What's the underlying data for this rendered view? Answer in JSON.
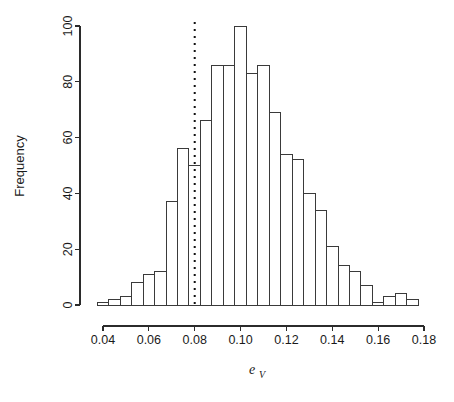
{
  "chart_data": {
    "type": "bar",
    "title": "",
    "subtitle": "",
    "xlabel": "e_V",
    "xlabel_base": "e",
    "xlabel_sub": "V",
    "ylabel": "Frequency",
    "xlim": [
      0.0355,
      0.1805
    ],
    "ylim": [
      0,
      103
    ],
    "grid": false,
    "legend": null,
    "bin_width": 0.005,
    "x_ticks": [
      0.04,
      0.06,
      0.08,
      0.1,
      0.12,
      0.14,
      0.16,
      0.18
    ],
    "x_tick_labels": [
      "0.04",
      "0.06",
      "0.08",
      "0.10",
      "0.12",
      "0.14",
      "0.16",
      "0.18"
    ],
    "y_ticks": [
      0,
      20,
      40,
      60,
      80,
      100
    ],
    "y_tick_labels": [
      "0",
      "20",
      "40",
      "60",
      "80",
      "100"
    ],
    "bin_edges": [
      0.0375,
      0.0425,
      0.0475,
      0.0525,
      0.0575,
      0.0625,
      0.0675,
      0.0725,
      0.0775,
      0.0825,
      0.0875,
      0.0925,
      0.0975,
      0.1025,
      0.1075,
      0.1125,
      0.1175,
      0.1225,
      0.1275,
      0.1325,
      0.1375,
      0.1425,
      0.1475,
      0.1525,
      0.1575,
      0.1625,
      0.1675,
      0.1725,
      0.1775
    ],
    "categories": [
      "0.0375-0.0425",
      "0.0425-0.0475",
      "0.0475-0.0525",
      "0.0525-0.0575",
      "0.0575-0.0625",
      "0.0625-0.0675",
      "0.0675-0.0725",
      "0.0725-0.0775",
      "0.0775-0.0825",
      "0.0825-0.0875",
      "0.0875-0.0925",
      "0.0925-0.0975",
      "0.0975-0.1025",
      "0.1025-0.1075",
      "0.1075-0.1125",
      "0.1125-0.1175",
      "0.1175-0.1225",
      "0.1225-0.1275",
      "0.1275-0.1325",
      "0.1325-0.1375",
      "0.1375-0.1425",
      "0.1425-0.1475",
      "0.1475-0.1525",
      "0.1525-0.1575",
      "0.1575-0.1625",
      "0.1625-0.1675",
      "0.1675-0.1725",
      "0.1725-0.1775"
    ],
    "values": [
      1,
      2,
      3,
      8,
      11,
      12,
      37,
      56,
      50,
      66,
      86,
      86,
      100,
      83,
      86,
      69,
      54,
      52,
      40,
      34,
      21,
      14,
      12,
      7,
      1,
      3,
      4,
      2
    ],
    "annotations": [
      {
        "name": "reference-line",
        "type": "vertical-dotted-line",
        "x": 0.08,
        "color": "#111111",
        "style": "dotted"
      }
    ]
  },
  "axes": {
    "y_axis_label": "Frequency",
    "x_axis_label_base": "e",
    "x_axis_label_sub": "V"
  },
  "colors": {
    "bar_fill": "#ffffff",
    "bar_stroke": "#3a3a3a",
    "axis": "#2b2b2b",
    "text": "#1a1a1a",
    "reference_line": "#111111",
    "background": "#ffffff"
  }
}
